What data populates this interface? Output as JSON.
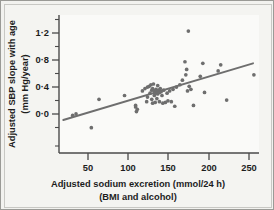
{
  "figure": {
    "background_color": "#f3f3f0",
    "plot_background_color": "#fafaf8",
    "border_color": "#9a9a96",
    "axis_color": "#4a4a4a",
    "point_color": "#6e6e6e",
    "line_color": "#6e6e6e"
  },
  "axes": {
    "x": {
      "label_line1": "Adjusted sodium excretion (mmol/24 h)",
      "label_line2": "(BMI and alcohol)",
      "ticks": [
        "50",
        "100",
        "150",
        "200",
        "250"
      ],
      "tick_values": [
        50,
        100,
        150,
        200,
        250
      ],
      "minor_tick_values": [
        25,
        75,
        125,
        175,
        225
      ],
      "range": [
        30,
        265
      ]
    },
    "y": {
      "label_line1": "Adjusted SBP slope with age",
      "label_line2": "(mm Hg/year)",
      "ticks": [
        "1·2",
        "0·8",
        "0·4",
        "0·0"
      ],
      "tick_values": [
        1.2,
        0.8,
        0.4,
        0.0
      ],
      "minor_tick_values": [
        1.4,
        1.0,
        0.6,
        0.2,
        -0.2
      ],
      "range": [
        -0.37,
        1.43
      ]
    }
  },
  "chart_data": {
    "type": "scatter",
    "title": "",
    "subtitle": "",
    "xlabel": "Adjusted sodium excretion (mmol/24 h) (BMI and alcohol)",
    "ylabel": "Adjusted SBP slope with age (mm Hg/year)",
    "xlim": [
      30,
      265
    ],
    "ylim": [
      -0.37,
      1.43
    ],
    "xticks": [
      50,
      100,
      150,
      200,
      250
    ],
    "yticks": [
      0.0,
      0.4,
      0.8,
      1.2
    ],
    "grid": false,
    "legend": "none",
    "marker": "filled-circle",
    "marker_color": "#6e6e6e",
    "points": [
      [
        46,
        0.12
      ],
      [
        50,
        0.14
      ],
      [
        68,
        -0.04
      ],
      [
        77,
        0.33
      ],
      [
        107,
        0.38
      ],
      [
        120,
        0.23
      ],
      [
        120,
        0.25
      ],
      [
        121,
        0.17
      ],
      [
        122,
        0.2
      ],
      [
        128,
        0.44
      ],
      [
        131,
        0.47
      ],
      [
        133,
        0.3
      ],
      [
        134,
        0.36
      ],
      [
        134,
        0.49
      ],
      [
        136,
        0.5
      ],
      [
        137,
        0.41
      ],
      [
        138,
        0.52
      ],
      [
        139,
        0.33
      ],
      [
        139,
        0.45
      ],
      [
        140,
        0.47
      ],
      [
        140,
        0.28
      ],
      [
        141,
        0.53
      ],
      [
        142,
        0.44
      ],
      [
        142,
        0.38
      ],
      [
        143,
        0.41
      ],
      [
        143,
        0.29
      ],
      [
        144,
        0.46
      ],
      [
        145,
        0.43
      ],
      [
        145,
        0.34
      ],
      [
        146,
        0.4
      ],
      [
        146,
        0.51
      ],
      [
        147,
        0.45
      ],
      [
        148,
        0.42
      ],
      [
        148,
        0.3
      ],
      [
        149,
        0.47
      ],
      [
        150,
        0.43
      ],
      [
        151,
        0.38
      ],
      [
        152,
        0.28
      ],
      [
        153,
        0.45
      ],
      [
        155,
        0.29
      ],
      [
        157,
        0.41
      ],
      [
        158,
        0.31
      ],
      [
        160,
        0.44
      ],
      [
        162,
        0.3
      ],
      [
        164,
        0.46
      ],
      [
        166,
        0.24
      ],
      [
        168,
        0.49
      ],
      [
        172,
        0.52
      ],
      [
        175,
        0.58
      ],
      [
        178,
        0.82
      ],
      [
        179,
        0.65
      ],
      [
        180,
        0.72
      ],
      [
        181,
        0.44
      ],
      [
        182,
        1.22
      ],
      [
        183,
        0.5
      ],
      [
        185,
        0.46
      ],
      [
        188,
        0.25
      ],
      [
        196,
        0.63
      ],
      [
        199,
        0.8
      ],
      [
        201,
        0.42
      ],
      [
        217,
        0.7
      ],
      [
        220,
        0.78
      ],
      [
        227,
        0.32
      ],
      [
        259,
        0.65
      ]
    ],
    "trend_line": {
      "type": "linear-fit",
      "x_start": 35,
      "y_start": 0.06,
      "x_end": 258,
      "y_end": 0.8
    }
  }
}
